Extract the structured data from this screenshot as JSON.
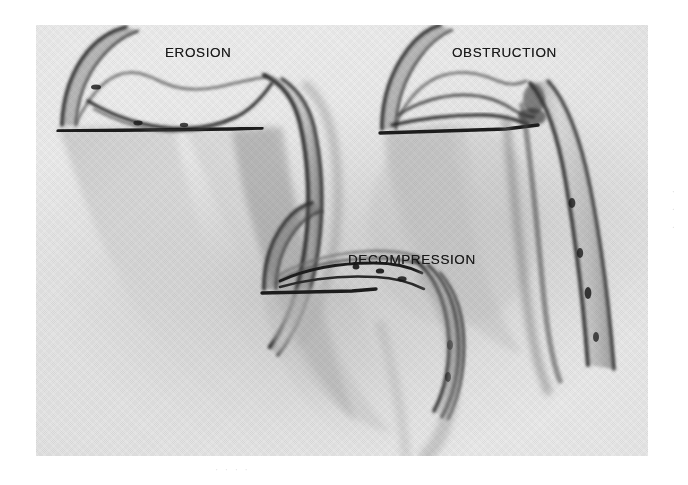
{
  "figure": {
    "kind": "medical-illustration-plate",
    "panels": [
      {
        "id": "erosion",
        "label": "EROSION",
        "icon": "erosion-illustration-icon",
        "position": "top-left"
      },
      {
        "id": "obstruction",
        "label": "OBSTRUCTION",
        "icon": "obstruction-illustration-icon",
        "position": "top-right"
      },
      {
        "id": "decompression",
        "label": "DECOMPRESSION",
        "icon": "decompression-illustration-icon",
        "position": "bottom-center"
      }
    ]
  },
  "artifacts": {
    "bottom_smudge": "· · · ·",
    "right_margin_marks": "· · ·"
  },
  "colors": {
    "page_background": "#ffffff",
    "plate_background": "#e9e9e9",
    "ink_dark": "#242424",
    "ink_mid": "#7a7a7a",
    "shadow_gray": "#b0b0b0",
    "label_text": "#1a1a1a"
  }
}
